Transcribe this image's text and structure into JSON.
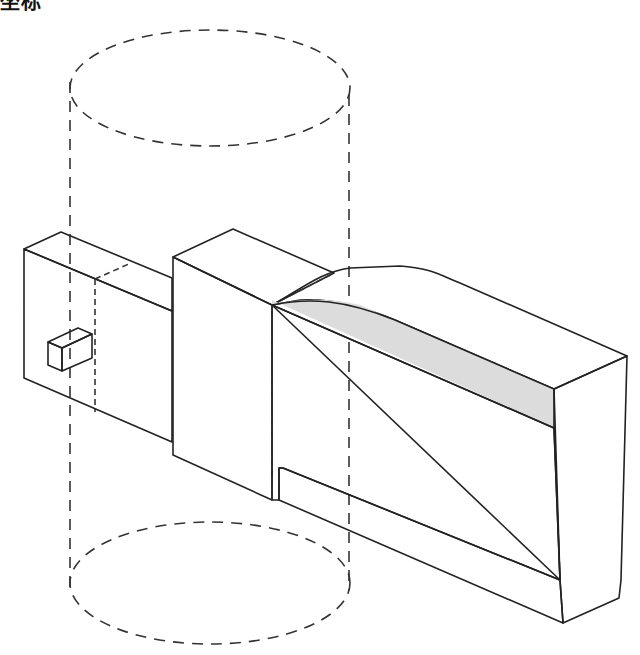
{
  "title": "坐标",
  "figure": {
    "colors": {
      "front_face": "#d6d6d6",
      "top_face": "#ececec",
      "side_face": "#cfcfcf",
      "edge": "#222222",
      "hidden_line": "#333333"
    },
    "elements": [
      "dashed-cylinder",
      "left-block",
      "small-tab",
      "middle-block",
      "right-wedge-block"
    ]
  }
}
